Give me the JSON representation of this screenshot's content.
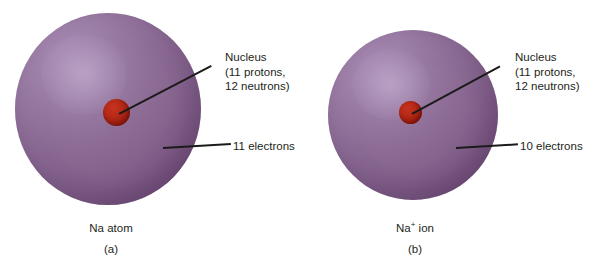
{
  "figure": {
    "background_color": "#ffffff",
    "width": 591,
    "height": 271
  },
  "colors": {
    "sphere_light": "#a98bb4",
    "sphere_mid": "#8d6d96",
    "sphere_dark": "#67456f",
    "nucleus_red": "#b62a17",
    "leader_line": "#1b1b1b",
    "text": "#231f20"
  },
  "panels": [
    {
      "id": "a",
      "letter": "(a)",
      "caption": "Na atom",
      "caption_symbol": "Na",
      "caption_charge": "",
      "caption_suffix": " atom",
      "nucleus_label": {
        "line1": "Nucleus",
        "line2": "(11 protons,",
        "line3": "12 neutrons)"
      },
      "electron_label": "11 electrons",
      "protons": 11,
      "neutrons": 12,
      "electrons": 11
    },
    {
      "id": "b",
      "letter": "(b)",
      "caption": "Na+ ion",
      "caption_symbol": "Na",
      "caption_charge": "+",
      "caption_suffix": " ion",
      "nucleus_label": {
        "line1": "Nucleus",
        "line2": "(11 protons,",
        "line3": "12 neutrons)"
      },
      "electron_label": "10 electrons",
      "protons": 11,
      "neutrons": 12,
      "electrons": 10
    }
  ]
}
